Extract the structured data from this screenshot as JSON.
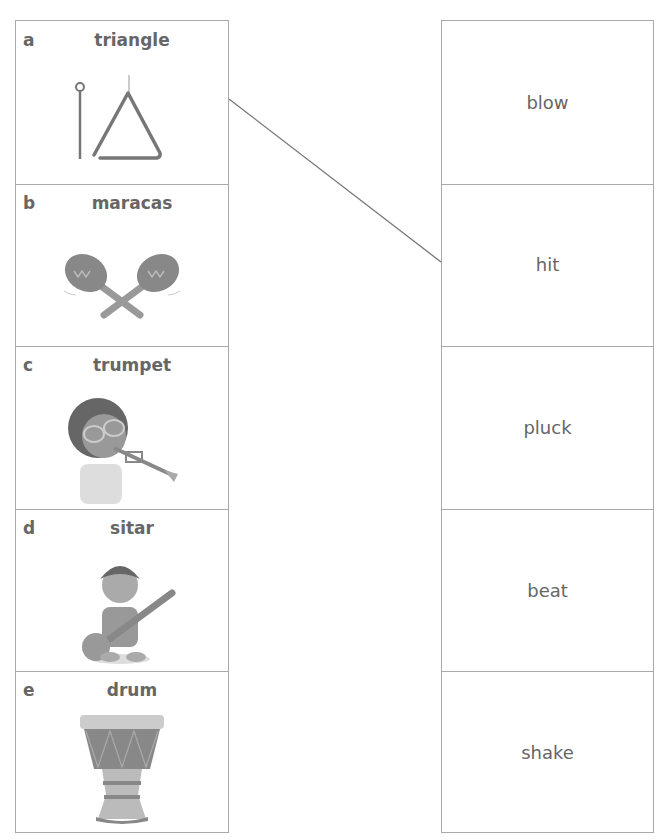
{
  "instruments": [
    {
      "letter": "a",
      "name": "triangle",
      "image": "triangle-icon"
    },
    {
      "letter": "b",
      "name": "maracas",
      "image": "maracas-icon"
    },
    {
      "letter": "c",
      "name": "trumpet",
      "image": "child-playing-trumpet-icon"
    },
    {
      "letter": "d",
      "name": "sitar",
      "image": "child-playing-sitar-icon"
    },
    {
      "letter": "e",
      "name": "drum",
      "image": "drum-icon"
    }
  ],
  "actions": [
    {
      "label": "blow"
    },
    {
      "label": "hit"
    },
    {
      "label": "pluck"
    },
    {
      "label": "beat"
    },
    {
      "label": "shake"
    }
  ],
  "connections": [
    {
      "from": "triangle",
      "to": "hit"
    }
  ],
  "colors": {
    "border": "#a9a9a9",
    "text": "#666666",
    "line": "#777777"
  }
}
